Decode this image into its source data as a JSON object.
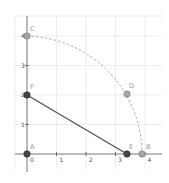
{
  "diagram": {
    "type": "geometry-construction",
    "axes": {
      "x_ticks": [
        "0",
        "1",
        "2",
        "3",
        "4"
      ],
      "y_ticks": [
        "1",
        "2",
        "3",
        "4"
      ],
      "origin_px": [
        27,
        154
      ],
      "unit_px": 29.5
    },
    "points": [
      {
        "name": "A",
        "x": 0,
        "y": 0,
        "color": "#444444"
      },
      {
        "name": "B",
        "x": 3.9,
        "y": 0,
        "color": "#999999"
      },
      {
        "name": "C",
        "x": 0,
        "y": 4,
        "color": "#999999"
      },
      {
        "name": "D",
        "x": 3.4,
        "y": 2.0,
        "color": "#999999"
      },
      {
        "name": "E",
        "x": 3.4,
        "y": 0,
        "color": "#444444"
      },
      {
        "name": "F",
        "x": 0,
        "y": 2,
        "color": "#444444"
      }
    ],
    "segments": [
      {
        "from": "F",
        "to": "E",
        "color": "#555555"
      }
    ],
    "arcs": [
      {
        "center": "A",
        "radius": 4,
        "from_angle": 0,
        "to_angle": 90,
        "style": "dashed",
        "color": "#aaaaaa"
      }
    ],
    "colors": {
      "grid": "#e6e6e6",
      "axis": "#666666",
      "dark_point": "#444444",
      "light_point": "#a6a6a6"
    }
  }
}
